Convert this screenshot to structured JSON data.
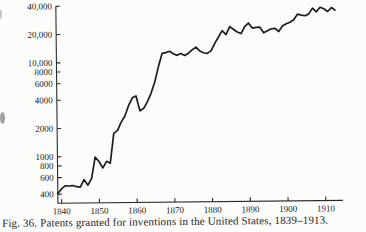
{
  "figure": {
    "caption": "Fig. 36.  Patents granted for inventions in the United States, 1839–1913."
  },
  "colors": {
    "background": "#fcfcfa",
    "line": "#1d1d1d",
    "axis": "#2a2a2a",
    "text": "#262626"
  },
  "chart_data": {
    "type": "line",
    "title": "",
    "xlabel": "",
    "ylabel": "",
    "legend": "none",
    "grid": false,
    "y_scale": "log",
    "xlim": [
      1839,
      1914
    ],
    "ylim": [
      320,
      40000
    ],
    "x_tick_values": [
      1840,
      1850,
      1860,
      1870,
      1880,
      1890,
      1900,
      1910
    ],
    "x_tick_labels": [
      "1840",
      "1850",
      "1860",
      "1870",
      "1880",
      "1890",
      "1900",
      "1910"
    ],
    "y_tick_values": [
      400,
      600,
      800,
      1000,
      2000,
      4000,
      6000,
      8000,
      10000,
      20000,
      40000
    ],
    "y_tick_labels": [
      "400",
      "600",
      "800",
      "1000",
      "2000",
      "4000",
      "6000",
      "8000",
      "10,000",
      "20,000",
      "40,000"
    ],
    "series": [
      {
        "name": "Patents granted for inventions",
        "x": [
          1839,
          1840,
          1841,
          1842,
          1843,
          1844,
          1845,
          1846,
          1847,
          1848,
          1849,
          1850,
          1851,
          1852,
          1853,
          1854,
          1855,
          1856,
          1857,
          1858,
          1859,
          1860,
          1861,
          1862,
          1863,
          1864,
          1865,
          1866,
          1867,
          1868,
          1869,
          1870,
          1871,
          1872,
          1873,
          1874,
          1875,
          1876,
          1877,
          1878,
          1879,
          1880,
          1881,
          1882,
          1883,
          1884,
          1885,
          1886,
          1887,
          1888,
          1889,
          1890,
          1891,
          1892,
          1893,
          1894,
          1895,
          1896,
          1897,
          1898,
          1899,
          1900,
          1901,
          1902,
          1903,
          1904,
          1905,
          1906,
          1907,
          1908,
          1909,
          1910,
          1911,
          1912,
          1913
        ],
        "values": [
          404,
          458,
          490,
          488,
          493,
          478,
          473,
          566,
          495,
          583,
          984,
          883,
          752,
          885,
          844,
          1755,
          1881,
          2302,
          2674,
          3455,
          4160,
          4357,
          3020,
          3214,
          3773,
          4630,
          6088,
          8863,
          12277,
          12526,
          12931,
          12137,
          11659,
          12180,
          11616,
          12230,
          13291,
          14169,
          12920,
          12345,
          12165,
          12903,
          15500,
          18091,
          21162,
          19118,
          23285,
          21767,
          20403,
          19551,
          23324,
          25313,
          22312,
          22647,
          22750,
          19855,
          20856,
          21822,
          22067,
          20377,
          23278,
          24644,
          25546,
          27119,
          31029,
          30258,
          29775,
          31170,
          35859,
          32735,
          36561,
          35141,
          32856,
          36198,
          33917
        ]
      }
    ]
  }
}
